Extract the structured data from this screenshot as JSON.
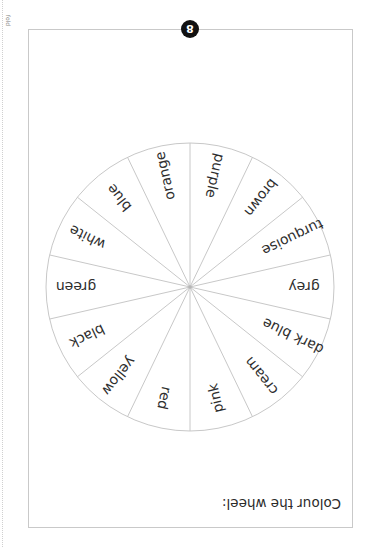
{
  "page": {
    "fold_label": "fold",
    "page_number": "8",
    "instruction": "Colour the wheel:"
  },
  "wheel": {
    "segments_count": 14,
    "line_color": "#c8c8c8",
    "segments_clockwise_from_top": [
      "purple",
      "brown",
      "turquoise",
      "grey",
      "dark blue",
      "cream",
      "pink",
      "red",
      "yellow",
      "black",
      "green",
      "white",
      "blue",
      "orange"
    ]
  }
}
